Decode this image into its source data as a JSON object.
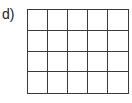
{
  "label": "d)",
  "grid": {
    "rows": 4,
    "cols": 5,
    "line_color": "#3a3a3a"
  }
}
